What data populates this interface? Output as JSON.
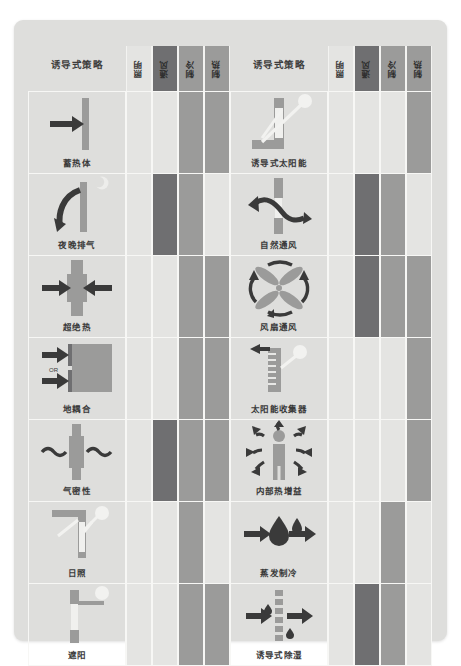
{
  "figure": {
    "type": "matrix-table",
    "card_background": "#dededc",
    "panel_count": 2,
    "rows_per_panel": 7
  },
  "legend": {
    "levels": [
      {
        "name": "none",
        "color": "#e4e4e2"
      },
      {
        "name": "medium",
        "color": "#9b9b9a"
      },
      {
        "name": "high",
        "color": "#6f6f71"
      }
    ]
  },
  "columns": {
    "strategy_header": "诱导式策略",
    "metrics": [
      {
        "key": "lighting",
        "label": "照明",
        "header_level": "none"
      },
      {
        "key": "ventilation",
        "label": "通风",
        "header_level": "high"
      },
      {
        "key": "cooling",
        "label": "制冷",
        "header_level": "medium"
      },
      {
        "key": "heating",
        "label": "制热",
        "header_level": "medium"
      }
    ]
  },
  "panels": [
    {
      "id": "left",
      "title": "诱导式策略",
      "rows": [
        {
          "label": "蓄热体",
          "icon": "thermal-mass-icon",
          "levels": [
            "none",
            "none",
            "medium",
            "medium"
          ]
        },
        {
          "label": "夜晚排气",
          "icon": "night-purge-icon",
          "levels": [
            "none",
            "high",
            "medium",
            "none"
          ]
        },
        {
          "label": "超绝热",
          "icon": "super-insulation-icon",
          "levels": [
            "none",
            "none",
            "medium",
            "medium"
          ]
        },
        {
          "label": "地耦合",
          "icon": "ground-coupling-icon",
          "levels": [
            "none",
            "none",
            "medium",
            "medium"
          ]
        },
        {
          "label": "气密性",
          "icon": "airtightness-icon",
          "levels": [
            "none",
            "high",
            "medium",
            "medium"
          ]
        },
        {
          "label": "日照",
          "icon": "daylighting-icon",
          "levels": [
            "none",
            "none",
            "medium",
            "none"
          ]
        },
        {
          "label": "遮阳",
          "icon": "shading-icon",
          "levels": [
            "none",
            "none",
            "medium",
            "medium"
          ]
        }
      ]
    },
    {
      "id": "right",
      "title": "诱导式策略",
      "rows": [
        {
          "label": "诱导式太阳能",
          "icon": "passive-solar-icon",
          "levels": [
            "none",
            "none",
            "none",
            "medium"
          ]
        },
        {
          "label": "自然通风",
          "icon": "natural-ventilation-icon",
          "levels": [
            "none",
            "high",
            "medium",
            "none"
          ]
        },
        {
          "label": "风扇通风",
          "icon": "fan-ventilation-icon",
          "levels": [
            "none",
            "high",
            "medium",
            "medium"
          ]
        },
        {
          "label": "太阳能收集器",
          "icon": "solar-collector-icon",
          "levels": [
            "none",
            "none",
            "none",
            "medium"
          ]
        },
        {
          "label": "内部热增益",
          "icon": "internal-gains-icon",
          "levels": [
            "none",
            "none",
            "none",
            "medium"
          ]
        },
        {
          "label": "蒸发制冷",
          "icon": "evaporative-cooling-icon",
          "levels": [
            "none",
            "none",
            "medium",
            "none"
          ]
        },
        {
          "label": "诱导式除湿",
          "icon": "dehumidification-icon",
          "levels": [
            "none",
            "high",
            "medium",
            "none"
          ]
        }
      ]
    }
  ]
}
